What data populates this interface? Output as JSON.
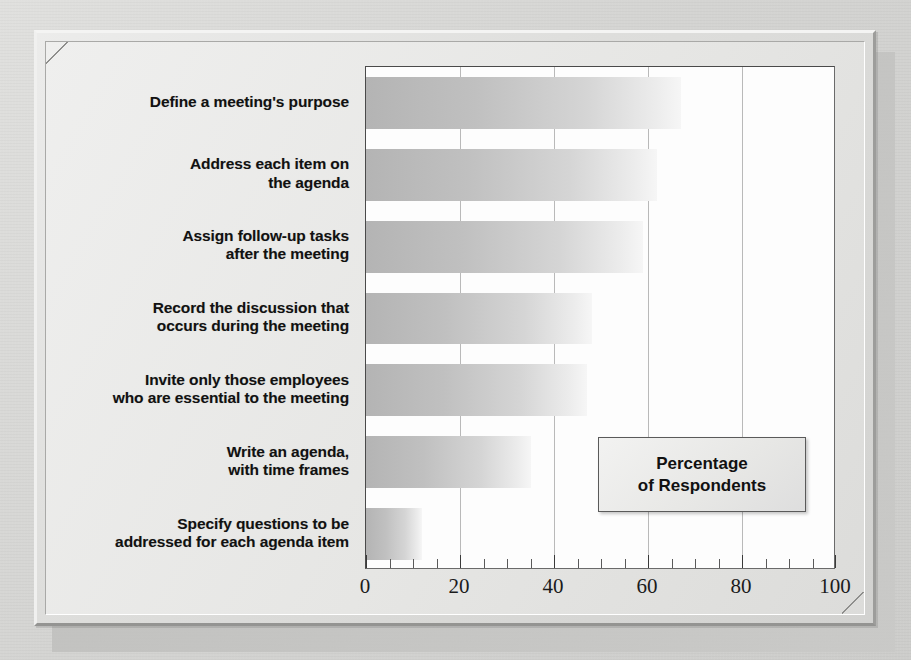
{
  "figure": {
    "frame_style": "beveled-raised",
    "background_color": "#d8d8d6",
    "plot_background": "#fdfdfd"
  },
  "legend": {
    "line1": "Percentage",
    "line2": "of Respondents"
  },
  "axis": {
    "tick_labels": [
      "0",
      "20",
      "40",
      "60",
      "80",
      "100"
    ]
  },
  "chart_data": {
    "type": "bar",
    "orientation": "horizontal",
    "title": "",
    "subtitle": "",
    "xlabel": "Percentage of Respondents",
    "ylabel": "",
    "xlim": [
      0,
      100
    ],
    "xticks": [
      0,
      20,
      40,
      60,
      80,
      100
    ],
    "minor_tick_interval": 5,
    "grid": "vertical-major",
    "legend_position": "inside-lower-right",
    "bar_fill": "horizontal-gradient-gray",
    "bar_color_start": "#b4b4b4",
    "bar_color_end": "#f6f6f6",
    "categories": [
      "Define a meeting's purpose",
      "Address each item on\nthe agenda",
      "Assign follow-up tasks\nafter the meeting",
      "Record the discussion that\noccurs during the meeting",
      "Invite only those employees\nwho are essential to the meeting",
      "Write an agenda,\nwith time frames",
      "Specify questions to be\naddressed for each agenda item"
    ],
    "values": [
      67,
      62,
      59,
      48,
      47,
      35,
      12
    ]
  }
}
